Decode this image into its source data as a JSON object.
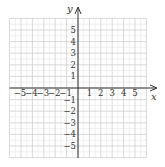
{
  "chart_data": {
    "type": "scatter",
    "title": "",
    "xlabel": "x",
    "ylabel": "y",
    "xlim": [
      -6,
      6
    ],
    "ylim": [
      -6,
      6
    ],
    "grid": true,
    "minor_grid": true,
    "x_tick_labels": [
      "−5",
      "−4",
      "−3",
      "−2",
      "−1",
      "1",
      "2",
      "3",
      "4",
      "5"
    ],
    "y_tick_labels": [
      "5",
      "4",
      "3",
      "2",
      "1",
      "−1",
      "−2",
      "−3",
      "−4",
      "−5"
    ],
    "series": [],
    "legend": null
  },
  "colors": {
    "axis": "#333333",
    "major_grid": "#cfcfcf",
    "minor_grid": "#e6e6e6",
    "text": "#333333"
  }
}
